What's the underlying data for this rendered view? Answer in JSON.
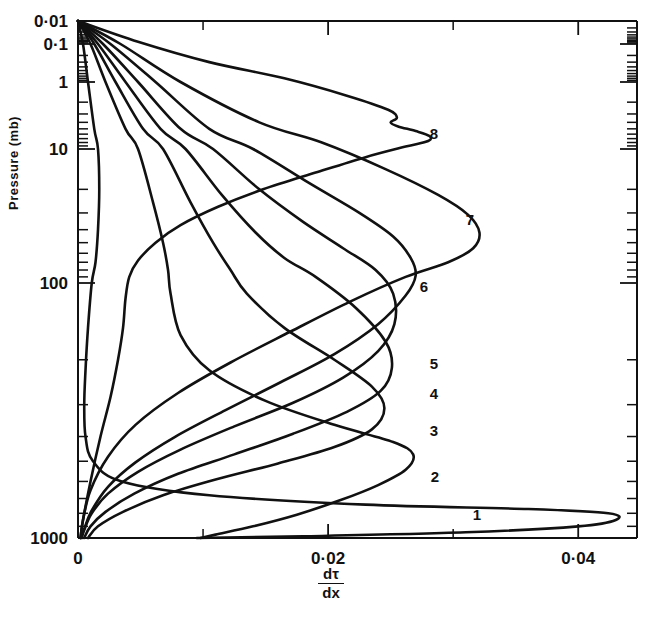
{
  "figure": {
    "title": "",
    "background": "#ffffff",
    "line_color": "#111111"
  },
  "axes": {
    "y": {
      "label": "Pressure (mb)",
      "scale": "log",
      "inverted": true,
      "tick_labels": [
        "0·01",
        "0·1",
        "1",
        "10",
        "100",
        "1000"
      ],
      "tick_values": [
        0.01,
        0.1,
        1,
        10,
        100,
        1000
      ],
      "minor_ticks": true
    },
    "x": {
      "label_numerator": "dτ",
      "label_denominator": "dx",
      "scale": "linear",
      "tick_labels": [
        "0",
        "0·02",
        "0·04"
      ],
      "tick_values": [
        0,
        0.02,
        0.04
      ],
      "minor_tick_values": [
        0.01,
        0.03
      ],
      "xlim": [
        0,
        0.0447
      ]
    }
  },
  "curve_labels": [
    "1",
    "2",
    "3",
    "4",
    "5",
    "6",
    "7",
    "8"
  ],
  "chart_data": {
    "type": "line",
    "title": "",
    "xlabel": "dτ/dx",
    "ylabel": "Pressure (mb)",
    "xlim": [
      0,
      0.0447
    ],
    "ylim": [
      0.01,
      1000
    ],
    "yscale": "log",
    "yinverted": true,
    "grid": false,
    "legend": "inline-curve-labels",
    "annotations": [
      "1",
      "2",
      "3",
      "4",
      "5",
      "6",
      "7",
      "8"
    ],
    "series": [
      {
        "name": "1",
        "label": "1",
        "peak_x": 0.0425,
        "peak_pressure": 760,
        "points": [
          [
            0.0,
            0.01
          ],
          [
            0.0004,
            0.1
          ],
          [
            0.0008,
            1
          ],
          [
            0.0013,
            5
          ],
          [
            0.0016,
            10
          ],
          [
            0.0017,
            20
          ],
          [
            0.0016,
            40
          ],
          [
            0.0014,
            70
          ],
          [
            0.0011,
            100
          ],
          [
            0.0008,
            150
          ],
          [
            0.0006,
            220
          ],
          [
            0.0005,
            300
          ],
          [
            0.0006,
            400
          ],
          [
            0.0012,
            500
          ],
          [
            0.0035,
            600
          ],
          [
            0.0105,
            680
          ],
          [
            0.023,
            740
          ],
          [
            0.036,
            770
          ],
          [
            0.0424,
            800
          ],
          [
            0.043,
            850
          ],
          [
            0.04,
            900
          ],
          [
            0.031,
            950
          ],
          [
            0.018,
            985
          ],
          [
            0.0095,
            1000
          ]
        ]
      },
      {
        "name": "2",
        "label": "2",
        "peak_x": 0.0268,
        "peak_pressure": 430,
        "points": [
          [
            0.0,
            0.01
          ],
          [
            0.001,
            0.1
          ],
          [
            0.0022,
            1
          ],
          [
            0.0038,
            5
          ],
          [
            0.0048,
            10
          ],
          [
            0.006,
            25
          ],
          [
            0.0068,
            50
          ],
          [
            0.0072,
            80
          ],
          [
            0.0074,
            110
          ],
          [
            0.0082,
            160
          ],
          [
            0.0105,
            220
          ],
          [
            0.015,
            290
          ],
          [
            0.0205,
            360
          ],
          [
            0.0252,
            420
          ],
          [
            0.0268,
            470
          ],
          [
            0.0262,
            540
          ],
          [
            0.024,
            620
          ],
          [
            0.021,
            710
          ],
          [
            0.0175,
            810
          ],
          [
            0.014,
            900
          ],
          [
            0.011,
            970
          ],
          [
            0.0098,
            1000
          ]
        ]
      },
      {
        "name": "3",
        "label": "3",
        "peak_x": 0.0245,
        "peak_pressure": 300,
        "points": [
          [
            0.0,
            0.01
          ],
          [
            0.0013,
            0.1
          ],
          [
            0.003,
            1
          ],
          [
            0.0052,
            5
          ],
          [
            0.0068,
            10
          ],
          [
            0.009,
            25
          ],
          [
            0.0108,
            50
          ],
          [
            0.0122,
            80
          ],
          [
            0.0135,
            110
          ],
          [
            0.0165,
            150
          ],
          [
            0.0205,
            200
          ],
          [
            0.0235,
            255
          ],
          [
            0.0245,
            310
          ],
          [
            0.0235,
            375
          ],
          [
            0.0205,
            440
          ],
          [
            0.016,
            510
          ],
          [
            0.011,
            590
          ],
          [
            0.0068,
            680
          ],
          [
            0.0036,
            790
          ],
          [
            0.0016,
            900
          ],
          [
            0.0008,
            1000
          ]
        ]
      },
      {
        "name": "4",
        "label": "4",
        "peak_x": 0.025,
        "peak_pressure": 205,
        "points": [
          [
            0.0,
            0.01
          ],
          [
            0.0016,
            0.1
          ],
          [
            0.0038,
            1
          ],
          [
            0.0066,
            5
          ],
          [
            0.0086,
            10
          ],
          [
            0.0115,
            22
          ],
          [
            0.0142,
            42
          ],
          [
            0.0165,
            65
          ],
          [
            0.019,
            90
          ],
          [
            0.0222,
            125
          ],
          [
            0.0246,
            170
          ],
          [
            0.0251,
            215
          ],
          [
            0.0242,
            265
          ],
          [
            0.0215,
            320
          ],
          [
            0.0172,
            390
          ],
          [
            0.0125,
            470
          ],
          [
            0.008,
            560
          ],
          [
            0.0045,
            670
          ],
          [
            0.0022,
            790
          ],
          [
            0.001,
            900
          ],
          [
            0.0005,
            1000
          ]
        ]
      },
      {
        "name": "5",
        "label": "5",
        "peak_x": 0.0252,
        "peak_pressure": 140,
        "points": [
          [
            0.0,
            0.01
          ],
          [
            0.002,
            0.1
          ],
          [
            0.0048,
            1
          ],
          [
            0.0082,
            5
          ],
          [
            0.0108,
            10
          ],
          [
            0.0145,
            20
          ],
          [
            0.018,
            35
          ],
          [
            0.0212,
            55
          ],
          [
            0.0238,
            80
          ],
          [
            0.0252,
            110
          ],
          [
            0.0253,
            145
          ],
          [
            0.024,
            185
          ],
          [
            0.0212,
            235
          ],
          [
            0.0172,
            295
          ],
          [
            0.0125,
            365
          ],
          [
            0.0082,
            450
          ],
          [
            0.0048,
            550
          ],
          [
            0.0024,
            670
          ],
          [
            0.0011,
            800
          ],
          [
            0.0005,
            930
          ],
          [
            0.0003,
            1000
          ]
        ]
      },
      {
        "name": "6",
        "label": "6",
        "peak_x": 0.0268,
        "peak_pressure": 95,
        "points": [
          [
            0.0,
            0.01
          ],
          [
            0.0026,
            0.1
          ],
          [
            0.0062,
            1
          ],
          [
            0.0105,
            5
          ],
          [
            0.014,
            10
          ],
          [
            0.0185,
            18
          ],
          [
            0.0225,
            30
          ],
          [
            0.0252,
            45
          ],
          [
            0.0266,
            65
          ],
          [
            0.027,
            88
          ],
          [
            0.0262,
            112
          ],
          [
            0.024,
            145
          ],
          [
            0.0205,
            190
          ],
          [
            0.0162,
            245
          ],
          [
            0.0118,
            315
          ],
          [
            0.0078,
            400
          ],
          [
            0.0046,
            505
          ],
          [
            0.0024,
            630
          ],
          [
            0.0011,
            780
          ],
          [
            0.0005,
            920
          ],
          [
            0.0002,
            1000
          ]
        ]
      },
      {
        "name": "7",
        "label": "7",
        "peak_x": 0.032,
        "peak_pressure": 44,
        "points": [
          [
            0.0,
            0.01
          ],
          [
            0.0034,
            0.1
          ],
          [
            0.0082,
            1
          ],
          [
            0.0145,
            4
          ],
          [
            0.0195,
            8
          ],
          [
            0.0245,
            14
          ],
          [
            0.0288,
            22
          ],
          [
            0.0312,
            31
          ],
          [
            0.0321,
            42
          ],
          [
            0.0316,
            55
          ],
          [
            0.0296,
            70
          ],
          [
            0.0262,
            90
          ],
          [
            0.0218,
            118
          ],
          [
            0.017,
            155
          ],
          [
            0.0122,
            205
          ],
          [
            0.008,
            270
          ],
          [
            0.0046,
            360
          ],
          [
            0.0024,
            480
          ],
          [
            0.001,
            650
          ],
          [
            0.0004,
            850
          ],
          [
            0.0002,
            1000
          ]
        ]
      },
      {
        "name": "8",
        "label": "8",
        "peak_x": 0.0282,
        "peak_pressure": 6.5,
        "points": [
          [
            0.0,
            0.01
          ],
          [
            0.0048,
            0.08
          ],
          [
            0.0105,
            0.3
          ],
          [
            0.0165,
            0.8
          ],
          [
            0.0215,
            1.6
          ],
          [
            0.0248,
            2.6
          ],
          [
            0.0255,
            3.4
          ],
          [
            0.025,
            4.0
          ],
          [
            0.0256,
            4.6
          ],
          [
            0.027,
            5.4
          ],
          [
            0.0281,
            6.4
          ],
          [
            0.028,
            7.6
          ],
          [
            0.0262,
            9.2
          ],
          [
            0.023,
            11.5
          ],
          [
            0.019,
            15
          ],
          [
            0.0148,
            20
          ],
          [
            0.0112,
            27
          ],
          [
            0.0082,
            37
          ],
          [
            0.0062,
            50
          ],
          [
            0.0048,
            68
          ],
          [
            0.0041,
            90
          ],
          [
            0.0038,
            115
          ],
          [
            0.0036,
            150
          ],
          [
            0.0032,
            200
          ],
          [
            0.0026,
            280
          ],
          [
            0.0018,
            400
          ],
          [
            0.001,
            600
          ],
          [
            0.0004,
            850
          ],
          [
            0.0002,
            1000
          ]
        ]
      }
    ]
  },
  "curve_label_positions": [
    {
      "label": "1",
      "x": 477,
      "y": 520
    },
    {
      "label": "2",
      "x": 435,
      "y": 482
    },
    {
      "label": "3",
      "x": 434,
      "y": 436
    },
    {
      "label": "4",
      "x": 434,
      "y": 399
    },
    {
      "label": "5",
      "x": 434,
      "y": 369
    },
    {
      "label": "6",
      "x": 424,
      "y": 292
    },
    {
      "label": "7",
      "x": 470,
      "y": 225
    },
    {
      "label": "8",
      "x": 434,
      "y": 139
    }
  ]
}
